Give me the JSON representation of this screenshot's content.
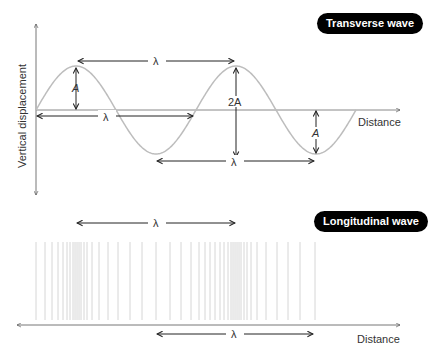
{
  "transverse": {
    "title": "Transverse wave",
    "y_axis_label": "Vertical displacement",
    "x_axis_label": "Distance",
    "wavelength_symbol": "λ",
    "amplitude_label": "A",
    "double_amplitude_label": "2A",
    "wave": {
      "x_start": 36,
      "x_end": 356,
      "baseline_y": 110,
      "amplitude_px": 44,
      "wavelength_px": 160
    }
  },
  "longitudinal": {
    "title": "Longitudinal wave",
    "x_axis_label": "Distance",
    "wavelength_symbol": "λ",
    "line_positions": [
      36,
      45,
      52,
      58,
      63,
      67,
      70,
      73,
      75,
      77,
      79,
      81,
      84,
      87,
      92,
      99,
      108,
      118,
      130,
      142,
      156,
      170,
      181,
      191,
      199,
      205,
      210,
      215,
      220,
      224,
      228,
      231,
      233,
      235,
      237,
      239,
      241,
      244,
      247,
      251,
      257,
      266,
      277,
      288,
      300,
      315
    ]
  },
  "colors": {
    "wave": "#bdbdbd",
    "axis": "#555555",
    "arrow": "#222222",
    "pill_bg": "#000000",
    "pill_text": "#ffffff",
    "compression_lines": "#d6d6d6"
  }
}
